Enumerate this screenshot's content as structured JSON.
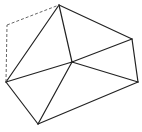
{
  "diagram": {
    "type": "geometric-figure",
    "colors": {
      "line": "#222222",
      "dashed": "#555555",
      "background": "#ffffff"
    },
    "points": {
      "A": [
        59,
        5
      ],
      "B": [
        132,
        39
      ],
      "C": [
        138,
        82
      ],
      "D": [
        38,
        124
      ],
      "E": [
        6,
        82
      ],
      "O": [
        72,
        62
      ],
      "P": [
        7,
        25
      ]
    },
    "solid_edges": [
      [
        "A",
        "B"
      ],
      [
        "B",
        "C"
      ],
      [
        "C",
        "D"
      ],
      [
        "D",
        "E"
      ],
      [
        "E",
        "A"
      ],
      [
        "A",
        "O"
      ],
      [
        "B",
        "O"
      ],
      [
        "C",
        "O"
      ],
      [
        "D",
        "O"
      ],
      [
        "E",
        "O"
      ]
    ],
    "dashed_edges": [
      [
        "E",
        "P"
      ],
      [
        "P",
        "A"
      ]
    ]
  }
}
